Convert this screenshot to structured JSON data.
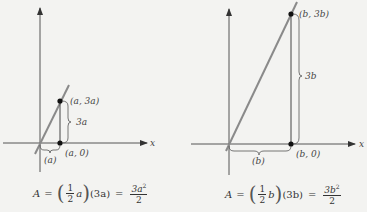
{
  "diagrams": [
    {
      "id": "left",
      "axis_label_x": "x",
      "top_point_label": "(a, 3a)",
      "bottom_point_label": "(a, 0)",
      "height_label": "3a",
      "base_label": "(a)",
      "formula": {
        "lhs": "A",
        "eq": "=",
        "frac_num": "1",
        "frac_den": "2",
        "var": "a",
        "second_factor": "(3a)",
        "eq2": "=",
        "result_num": "3a",
        "result_exp": "2",
        "result_den": "2"
      }
    },
    {
      "id": "right",
      "axis_label_x": "x",
      "top_point_label": "(b, 3b)",
      "bottom_point_label": "(b, 0)",
      "height_label": "3b",
      "base_label": "(b)",
      "formula": {
        "lhs": "A",
        "eq": "=",
        "frac_num": "1",
        "frac_den": "2",
        "var": "b",
        "second_factor": "(3b)",
        "eq2": "=",
        "result_num": "3b",
        "result_exp": "2",
        "result_den": "2"
      }
    }
  ],
  "colors": {
    "axis": "#555555",
    "line": "#8a8a8a",
    "point": "#111111",
    "background": "#f3f3f1"
  }
}
